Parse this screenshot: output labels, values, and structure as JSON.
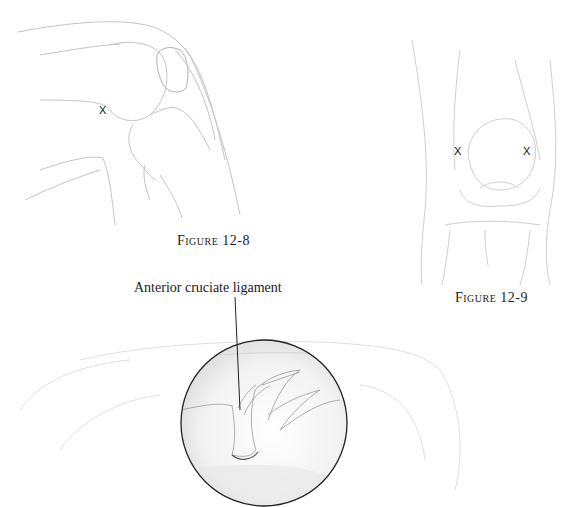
{
  "figures": [
    {
      "id": "12-8",
      "caption": "Figure 12-8",
      "view": "lateral knee, flexed",
      "markers": [
        {
          "symbol": "X",
          "x": 104,
          "y": 112
        }
      ]
    },
    {
      "id": "12-9",
      "caption": "Figure 12-9",
      "view": "anterior knee",
      "markers": [
        {
          "symbol": "X",
          "x": 458,
          "y": 152
        },
        {
          "symbol": "X",
          "x": 527,
          "y": 152
        }
      ]
    },
    {
      "id": "arthroscopic-view",
      "label": "Anterior cruciate ligament",
      "view": "arthroscopic circular inset"
    }
  ],
  "colors": {
    "line": "#bdbdbd",
    "dark_line": "#222222",
    "shading": "#d9d9d9"
  }
}
